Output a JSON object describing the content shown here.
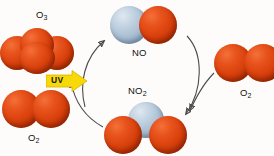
{
  "diagram": {
    "background_color": "#fdfcfa",
    "oxygen_color": "#d8400c",
    "nitrogen_color": "#a8bed2",
    "arrow_color": "#4a4a4a",
    "uv_badge_color": "#f5d90a"
  },
  "labels": {
    "ozone": "O",
    "ozone_sub": "3",
    "oxygen_left": "O",
    "oxygen_left_sub": "2",
    "oxygen_right": "O",
    "oxygen_right_sub": "2",
    "nitric_oxide": "NO",
    "nitrogen_dioxide": "NO",
    "nitrogen_dioxide_sub": "2",
    "uv": "UV"
  },
  "molecules": [
    {
      "name": "ozone",
      "formula": "O3",
      "atoms": [
        "O",
        "O",
        "O"
      ],
      "arrangement": "bent-triangular-cluster",
      "position": "top-left"
    },
    {
      "name": "oxygen-left",
      "formula": "O2",
      "atoms": [
        "O",
        "O"
      ],
      "arrangement": "horizontal-pair",
      "position": "bottom-left"
    },
    {
      "name": "nitric-oxide",
      "formula": "NO",
      "atoms": [
        "N",
        "O"
      ],
      "arrangement": "horizontal-pair",
      "position": "top-center"
    },
    {
      "name": "nitrogen-dioxide",
      "formula": "NO2",
      "atoms": [
        "N",
        "O",
        "O"
      ],
      "arrangement": "bent-nitrogen-apex",
      "position": "bottom-center"
    },
    {
      "name": "oxygen-right",
      "formula": "O2",
      "atoms": [
        "O",
        "O"
      ],
      "arrangement": "horizontal-pair",
      "position": "right"
    }
  ],
  "reactions": [
    {
      "name": "ozone-oxidizes-no",
      "from": "ozone",
      "to": "nitric-oxide",
      "direction": "up-right"
    },
    {
      "name": "no-to-no2",
      "from": "nitric-oxide",
      "to": "nitrogen-dioxide",
      "direction": "down-right"
    },
    {
      "name": "no2-photolysis",
      "from": "nitrogen-dioxide",
      "to": "ozone",
      "direction": "up-left",
      "agent": "UV"
    },
    {
      "name": "oxygen-joins-no",
      "from": "oxygen-right",
      "to": "nitrogen-dioxide",
      "direction": "down-left"
    }
  ]
}
